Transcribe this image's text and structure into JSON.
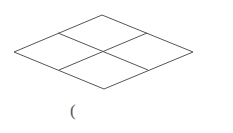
{
  "diagram": {
    "stroke_color": "#555555",
    "vertices": {
      "top": [
        102,
        15
      ],
      "left": [
        14,
        52
      ],
      "right": [
        193,
        52
      ],
      "bottom": [
        104,
        89
      ]
    },
    "midpoints": {
      "top_left": [
        58,
        33
      ],
      "top_right": [
        147,
        33
      ],
      "bottom_left": [
        59,
        70
      ],
      "bottom_right": [
        148,
        70
      ]
    }
  },
  "caption": {
    "text": "("
  }
}
